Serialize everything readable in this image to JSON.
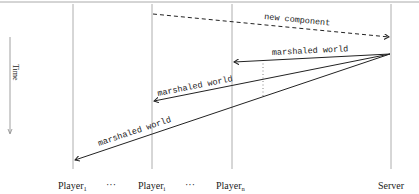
{
  "diagram": {
    "type": "sequence-diagram",
    "time_axis": {
      "label": "Time",
      "direction": "down"
    },
    "lifelines": [
      {
        "id": "player1",
        "label": "Player",
        "subscript": "1",
        "x": 73
      },
      {
        "id": "ellipsis1",
        "label": "···",
        "x": 113
      },
      {
        "id": "playeri",
        "label": "Player",
        "subscript": "i",
        "x": 152
      },
      {
        "id": "ellipsis2",
        "label": "···",
        "x": 192
      },
      {
        "id": "playern",
        "label": "Player",
        "subscript": "n",
        "x": 232
      },
      {
        "id": "server",
        "label": "Server",
        "x": 391
      }
    ],
    "messages": [
      {
        "from": "playeri",
        "to": "server",
        "label": "new component",
        "style": "dashed"
      },
      {
        "from": "server",
        "to": "playern",
        "label": "marshaled world",
        "style": "solid"
      },
      {
        "from": "server",
        "to": "playeri",
        "label": "marshaled world",
        "style": "solid"
      },
      {
        "from": "server",
        "to": "player1",
        "label": "marshaled world",
        "style": "solid"
      }
    ],
    "colors": {
      "line": "#222222",
      "lifeline": "#999999",
      "background": "#ffffff"
    }
  }
}
